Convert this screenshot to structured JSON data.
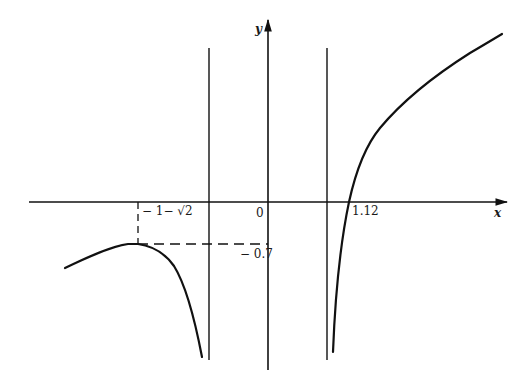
{
  "figure": {
    "type": "function-graph",
    "axes": {
      "x_label": "x",
      "y_label": "y",
      "origin_label": "0"
    },
    "annotations": {
      "local_max_x_label": "− 1− √2",
      "local_max_y_label": "− 0.7",
      "x_intercept_label": "1.12"
    },
    "vertical_asymptotes": [
      {
        "position": "left of y-axis"
      },
      {
        "position": "right of y-axis"
      }
    ],
    "branches": [
      {
        "name": "left-branch",
        "description": "rises to local maximum at x = -1-√2, y ≈ -0.7, then falls to -∞ at left asymptote"
      },
      {
        "name": "middle-region",
        "description": "empty between asymptotes"
      },
      {
        "name": "right-branch",
        "description": "rises from -∞ at right asymptote, crosses x-axis at 1.12, increases"
      }
    ],
    "colors": {
      "line": "#111111",
      "background": "#ffffff"
    }
  }
}
